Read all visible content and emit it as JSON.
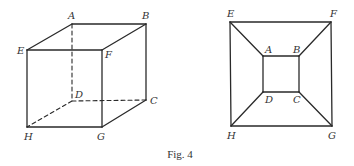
{
  "caption": "Fig. 4",
  "colors": {
    "line": "#2a2a2a",
    "text": "#333333",
    "background": "#ffffff"
  },
  "left_figure": {
    "description": "Cube in oblique perspective with hidden edges dashed",
    "vertices": {
      "A": {
        "label": "A",
        "x": 72,
        "y": 24
      },
      "B": {
        "label": "B",
        "x": 146,
        "y": 24
      },
      "C": {
        "label": "C",
        "x": 146,
        "y": 100
      },
      "D": {
        "label": "D",
        "x": 72,
        "y": 101
      },
      "E": {
        "label": "E",
        "x": 27,
        "y": 50
      },
      "F": {
        "label": "F",
        "x": 102,
        "y": 50
      },
      "G": {
        "label": "G",
        "x": 102,
        "y": 127
      },
      "H": {
        "label": "H",
        "x": 27,
        "y": 127
      }
    },
    "solid_edges": [
      "AB",
      "AE",
      "BF",
      "EF",
      "BC",
      "EH",
      "FG",
      "HG",
      "CG"
    ],
    "dashed_edges": [
      "AD",
      "DC",
      "DH"
    ]
  },
  "right_figure": {
    "description": "Planar (Schlegel) projection of the cube",
    "vertices": {
      "E": {
        "label": "E",
        "x": 230,
        "y": 22
      },
      "F": {
        "label": "F",
        "x": 331,
        "y": 22
      },
      "G": {
        "label": "G",
        "x": 332,
        "y": 126
      },
      "H": {
        "label": "H",
        "x": 231,
        "y": 126
      },
      "A": {
        "label": "A",
        "x": 263,
        "y": 56
      },
      "B": {
        "label": "B",
        "x": 299,
        "y": 56
      },
      "C": {
        "label": "C",
        "x": 299,
        "y": 92
      },
      "D": {
        "label": "D",
        "x": 263,
        "y": 92
      }
    },
    "edges": [
      "EF",
      "FG",
      "GH",
      "HE",
      "AB",
      "BC",
      "CD",
      "DA",
      "EA",
      "FB",
      "GC",
      "HD"
    ]
  }
}
